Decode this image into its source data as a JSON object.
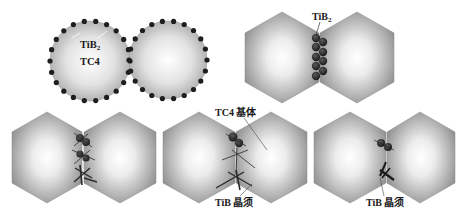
{
  "figure": {
    "colors": {
      "background": "#ffffff",
      "grain_edge": "#7a7a7a",
      "grain_center": "#ffffff",
      "particle": "#2a2a2a",
      "whisker": "#1a1a1a"
    }
  },
  "panels": {
    "a": {
      "label_tib2": "TiB",
      "label_tib2_sub": "2",
      "label_tc4": "TC4"
    },
    "b": {
      "label_tib2": "TiB",
      "label_tib2_sub": "2"
    },
    "c": {},
    "d": {
      "label_matrix": "TC4 基体",
      "label_whisker": "TiB 晶须"
    },
    "e": {
      "label_whisker": "TiB 晶须"
    }
  }
}
